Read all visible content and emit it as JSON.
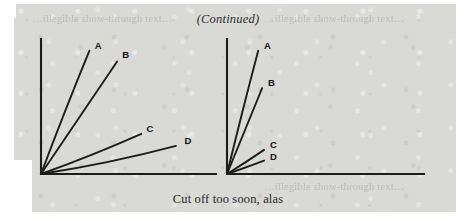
{
  "page": {
    "header_note": "(Continued)",
    "caption": "Cut off too soon, alas",
    "paper_color": "#d9d9d6",
    "ink_color": "#1c1c1c"
  },
  "ghost_text": {
    "left": "…illegible show-through text…",
    "right": "…illegible show-through text…",
    "bottom": "…illegible show-through text…"
  },
  "chart_data": [
    {
      "id": "left-chart",
      "type": "line",
      "title": "",
      "subtitle": "Full-length curves",
      "xlabel": "",
      "ylabel": "",
      "xlim": [
        0,
        100
      ],
      "ylim": [
        0,
        100
      ],
      "grid": false,
      "axes": {
        "x_axis": true,
        "y_axis": true,
        "ticks": false,
        "tick_labels": false
      },
      "legend": "inline-end-labels",
      "series": [
        {
          "name": "A",
          "x": [
            0,
            14,
            28
          ],
          "y": [
            0,
            48,
            92
          ],
          "label_x": 31,
          "label_y": 96
        },
        {
          "name": "B",
          "x": [
            0,
            22,
            44
          ],
          "y": [
            0,
            42,
            84
          ],
          "label_x": 47,
          "label_y": 89
        },
        {
          "name": "C",
          "x": [
            0,
            30,
            58
          ],
          "y": [
            0,
            14,
            30
          ],
          "label_x": 61,
          "label_y": 34
        },
        {
          "name": "D",
          "x": [
            0,
            40,
            78
          ],
          "y": [
            0,
            8,
            21
          ],
          "label_x": 83,
          "label_y": 25
        }
      ]
    },
    {
      "id": "right-chart",
      "type": "line",
      "title": "",
      "subtitle": "Curves cut off too soon",
      "xlabel": "",
      "ylabel": "",
      "xlim": [
        0,
        100
      ],
      "ylim": [
        0,
        100
      ],
      "grid": false,
      "axes": {
        "x_axis": true,
        "y_axis": true,
        "ticks": false,
        "tick_labels": false
      },
      "legend": "inline-end-labels",
      "series": [
        {
          "name": "A",
          "x": [
            0,
            8,
            16
          ],
          "y": [
            0,
            48,
            92
          ],
          "label_x": 19,
          "label_y": 96
        },
        {
          "name": "B",
          "x": [
            0,
            9,
            18
          ],
          "y": [
            0,
            32,
            64
          ],
          "label_x": 21,
          "label_y": 68
        },
        {
          "name": "C",
          "x": [
            0,
            10,
            19
          ],
          "y": [
            0,
            9,
            18
          ],
          "label_x": 22,
          "label_y": 22
        },
        {
          "name": "D",
          "x": [
            0,
            10,
            19
          ],
          "y": [
            0,
            5,
            10
          ],
          "label_x": 22,
          "label_y": 13
        }
      ]
    }
  ]
}
